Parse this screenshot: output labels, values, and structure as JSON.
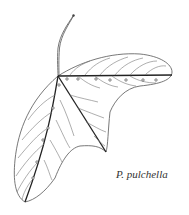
{
  "figure": {
    "caption": "P. pulchella",
    "line_color": "#555555",
    "midrib_color": "#222222"
  }
}
